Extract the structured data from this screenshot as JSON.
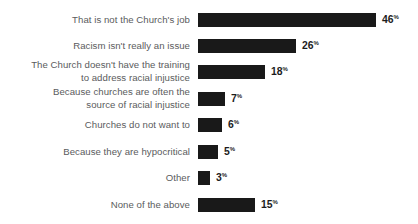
{
  "chart_data": {
    "type": "bar",
    "orientation": "horizontal",
    "title": "",
    "subtitle": "",
    "xlabel": "",
    "ylabel": "",
    "grid": false,
    "legend": null,
    "axis_visible": false,
    "value_suffix": "%",
    "xlim": [
      0,
      46
    ],
    "bar_color": "#191919",
    "label_color": "#5a5b5d",
    "value_color": "#1c1c1c",
    "background_color": "#ffffff",
    "categories": [
      "That is not the Church's job",
      "Racism isn't really an issue",
      "The Church doesn't have the training\nto address racial injustice",
      "Because churches are often the\nsource of racial injustice",
      "Churches do not want to",
      "Because they are hypocritical",
      "Other",
      "None of the above"
    ],
    "values": [
      46,
      26,
      18,
      7,
      6,
      5,
      3,
      15
    ],
    "value_labels": [
      "46",
      "26",
      "18",
      "7",
      "6",
      "5",
      "3",
      "15"
    ],
    "rows": [
      {
        "label": "That is not the Church's job",
        "value": 46,
        "value_label": "46",
        "lines": 1,
        "bar_px": 178,
        "top_px": 13
      },
      {
        "label": "Racism isn't really an issue",
        "value": 26,
        "value_label": "26",
        "lines": 1,
        "bar_px": 98,
        "top_px": 39
      },
      {
        "label": "The Church doesn't have the training\nto address racial injustice",
        "value": 18,
        "value_label": "18",
        "lines": 2,
        "bar_px": 67,
        "top_px": 65
      },
      {
        "label": "Because churches are often the\nsource of racial injustice",
        "value": 7,
        "value_label": "7",
        "lines": 2,
        "bar_px": 27,
        "top_px": 92
      },
      {
        "label": "Churches do not want to",
        "value": 6,
        "value_label": "6",
        "lines": 1,
        "bar_px": 24,
        "top_px": 118
      },
      {
        "label": "Because they are hypocritical",
        "value": 5,
        "value_label": "5",
        "lines": 1,
        "bar_px": 20,
        "top_px": 145
      },
      {
        "label": "Other",
        "value": 3,
        "value_label": "3",
        "lines": 1,
        "bar_px": 12,
        "top_px": 171
      },
      {
        "label": "None of the above",
        "value": 15,
        "value_label": "15",
        "lines": 1,
        "bar_px": 57,
        "top_px": 198
      }
    ]
  }
}
